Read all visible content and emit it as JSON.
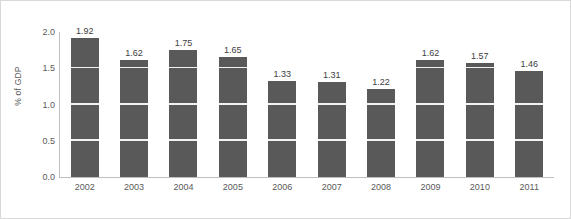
{
  "chart_data": {
    "type": "bar",
    "title": "",
    "subtitle": "",
    "xlabel": "",
    "ylabel": "% of GDP",
    "categories": [
      "2002",
      "2003",
      "2004",
      "2005",
      "2006",
      "2007",
      "2008",
      "2009",
      "2010",
      "2011"
    ],
    "values": [
      1.92,
      1.62,
      1.75,
      1.65,
      1.33,
      1.31,
      1.22,
      1.62,
      1.57,
      1.46
    ],
    "data_labels": [
      "1.92",
      "1.62",
      "1.75",
      "1.65",
      "1.33",
      "1.31",
      "1.22",
      "1.62",
      "1.57",
      "1.46"
    ],
    "ylim": [
      0.0,
      2.0
    ],
    "ytick_values": [
      0.0,
      0.5,
      1.0,
      1.5,
      2.0
    ],
    "ytick_labels": [
      "0.0",
      "0.5",
      "1.0",
      "1.5",
      "2.0"
    ],
    "gridlines": {
      "horizontal": true,
      "vertical": false,
      "values": [
        0.5,
        1.0,
        1.5
      ],
      "color": "#F2F2F2"
    },
    "legend": {
      "visible": false,
      "position": "none",
      "entries": []
    },
    "series": [
      {
        "name": "% of GDP",
        "color": "#595959",
        "values": [
          1.92,
          1.62,
          1.75,
          1.65,
          1.33,
          1.31,
          1.22,
          1.62,
          1.57,
          1.46
        ]
      }
    ],
    "colors": {
      "bar": "#595959",
      "axis": "#BFBFBF",
      "text": "#595959",
      "gridline": "#F2F2F2",
      "border": "#D9D9D9",
      "background": "#FFFFFF"
    }
  }
}
